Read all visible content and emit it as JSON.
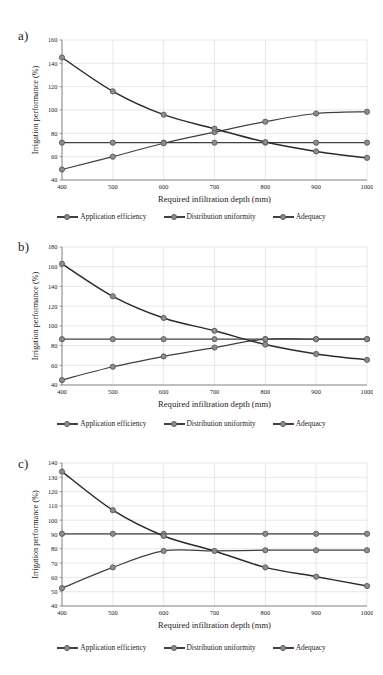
{
  "figure": {
    "panels": [
      {
        "label": "a)",
        "xlabel": "Required infiltration depth (mm)",
        "ylabel": "Irrigation performance (%)",
        "xticks": [
          "400",
          "500",
          "600",
          "700",
          "800",
          "900",
          "1000"
        ],
        "yticks": [
          "40",
          "60",
          "80",
          "100",
          "120",
          "140",
          "160"
        ],
        "legend": [
          "Application efficiency",
          "Distribution uniformity",
          "Adequacy"
        ]
      },
      {
        "label": "b)",
        "xlabel": "Required infiltration depth (mm)",
        "ylabel": "Irrigation performance (%)",
        "xticks": [
          "400",
          "500",
          "600",
          "700",
          "800",
          "900",
          "1000"
        ],
        "yticks": [
          "40",
          "60",
          "80",
          "100",
          "120",
          "140",
          "160",
          "180"
        ],
        "legend": [
          "Application efficiency",
          "Distribution uniformity",
          "Adequacy"
        ]
      },
      {
        "label": "c)",
        "xlabel": "Required infiltration depth (mm)",
        "ylabel": "Irrigation performance (%)",
        "xticks": [
          "400",
          "500",
          "600",
          "700",
          "800",
          "900",
          "1000"
        ],
        "yticks": [
          "40",
          "50",
          "60",
          "70",
          "80",
          "90",
          "100",
          "110",
          "120",
          "130",
          "140"
        ],
        "legend": [
          "Application efficiency",
          "Distribution uniformity",
          "Adequacy"
        ]
      }
    ],
    "colors": {
      "line": "#404040",
      "adequacy_line": "#2b2b2b",
      "marker_fill": "#8d8d8d",
      "marker_stroke": "#5a5a5a",
      "grid": "#d9d9d9",
      "axis": "#8a8a8a",
      "text": "#1a1a1a",
      "background": "#ffffff"
    }
  },
  "chart_data": [
    {
      "type": "line",
      "panel": "a)",
      "title": "",
      "xlabel": "Required infiltration depth (mm)",
      "ylabel": "Irrigation performance (%)",
      "x": [
        400,
        500,
        600,
        700,
        800,
        900,
        1000
      ],
      "xlim": [
        400,
        1000
      ],
      "ylim": [
        40,
        160
      ],
      "ytick_step": 20,
      "grid": true,
      "legend_position": "bottom",
      "series": [
        {
          "name": "Application efficiency",
          "values": [
            72,
            72,
            72,
            72,
            72,
            72,
            72
          ]
        },
        {
          "name": "Distribution uniformity",
          "values": [
            49,
            60,
            71.5,
            81,
            90,
            97,
            98.5
          ]
        },
        {
          "name": "Adequacy",
          "values": [
            145,
            116,
            96,
            84,
            72.5,
            64.5,
            59
          ]
        }
      ]
    },
    {
      "type": "line",
      "panel": "b)",
      "title": "",
      "xlabel": "Required infiltration depth (mm)",
      "ylabel": "Irrigation performance (%)",
      "x": [
        400,
        500,
        600,
        700,
        800,
        900,
        1000
      ],
      "xlim": [
        400,
        1000
      ],
      "ylim": [
        40,
        180
      ],
      "ytick_step": 20,
      "grid": true,
      "legend_position": "bottom",
      "series": [
        {
          "name": "Application efficiency",
          "values": [
            86.5,
            86.5,
            86.5,
            86.5,
            86.5,
            86.5,
            86.5
          ]
        },
        {
          "name": "Distribution uniformity",
          "values": [
            45,
            58.5,
            69,
            78,
            86.5,
            86.5,
            86.5
          ]
        },
        {
          "name": "Adequacy",
          "values": [
            163,
            130,
            108,
            95,
            81,
            71.5,
            65.5
          ]
        }
      ]
    },
    {
      "type": "line",
      "panel": "c)",
      "title": "",
      "xlabel": "Required infiltration depth (mm)",
      "ylabel": "Irrigation performance (%)",
      "x": [
        400,
        500,
        600,
        700,
        800,
        900,
        1000
      ],
      "xlim": [
        400,
        1000
      ],
      "ylim": [
        40,
        140
      ],
      "ytick_step": 10,
      "grid": true,
      "legend_position": "bottom",
      "series": [
        {
          "name": "Application efficiency",
          "values": [
            90.5,
            90.5,
            90.5,
            90.5,
            90.5,
            90.5,
            90.5
          ]
        },
        {
          "name": "Distribution uniformity",
          "values": [
            52.5,
            67,
            78.5,
            78.5,
            79,
            79,
            79
          ]
        },
        {
          "name": "Adequacy",
          "values": [
            134,
            107,
            89,
            78.5,
            67,
            60.5,
            54
          ]
        }
      ]
    }
  ]
}
